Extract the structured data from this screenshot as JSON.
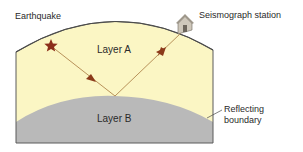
{
  "diagram": {
    "labels": {
      "earthquake": "Earthquake",
      "station": "Seismograph station",
      "layer_a": "Layer A",
      "layer_b": "Layer B",
      "boundary_line1": "Reflecting",
      "boundary_line2": "boundary"
    },
    "colors": {
      "layer_a": "#fbf6c4",
      "layer_b": "#b9b9b9",
      "outline": "#5a5a5a",
      "ray": "#b8925a",
      "arrow": "#8b3a1a",
      "star": "#8b2e1a",
      "house": "#c9c2b6"
    }
  }
}
